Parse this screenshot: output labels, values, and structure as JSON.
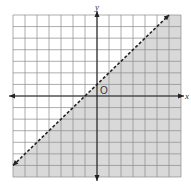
{
  "chart_data": {
    "type": "inequality-graph",
    "title": "",
    "inequality": "y < x + 1",
    "boundary_line": {
      "equation": "y = x + 1",
      "slope": 1,
      "y_intercept": 1,
      "style": "dashed",
      "points": [
        [
          -7,
          -6
        ],
        [
          6,
          7
        ]
      ]
    },
    "shaded_region": "below line",
    "x_range": [
      -7,
      7
    ],
    "y_range": [
      -7,
      7
    ],
    "grid": true,
    "grid_step": 1,
    "xlabel": "x",
    "ylabel": "y",
    "origin_label": "O",
    "colors": {
      "shade": "#d9d9d9",
      "grid": "#8a8a8a",
      "axis": "#222222"
    }
  }
}
